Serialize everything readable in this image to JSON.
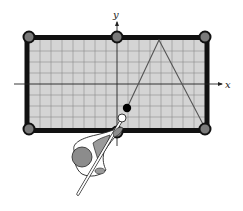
{
  "figure": {
    "axis_labels": {
      "x": "x",
      "y": "y"
    },
    "colors": {
      "table_felt": "#d4d4d4",
      "grid_line": "#8a8a8a",
      "cushion": "#111111",
      "pocket": "#7a7a7a",
      "axis": "#222222",
      "ball_path": "#555555",
      "object_ball": "#000000",
      "cue_ball": "#ffffff",
      "player_head": "#8c8c8c"
    },
    "table": {
      "units_wide": 16,
      "units_tall": 8,
      "x_range": [
        -8,
        8
      ],
      "y_range": [
        -4,
        4
      ]
    },
    "pockets": [
      {
        "name": "top-left",
        "x": -8,
        "y": 4
      },
      {
        "name": "top-middle",
        "x": 0,
        "y": 4
      },
      {
        "name": "top-right",
        "x": 8,
        "y": 4
      },
      {
        "name": "bottom-left",
        "x": -8,
        "y": -4
      },
      {
        "name": "bottom-middle",
        "x": 0,
        "y": -4
      },
      {
        "name": "bottom-right",
        "x": 8,
        "y": -4
      }
    ],
    "balls": {
      "object_ball": {
        "x": 1,
        "y": -2.2
      },
      "cue_ball": {
        "x": 0.5,
        "y": -3.1
      }
    },
    "path": [
      {
        "x": 1,
        "y": -2.2
      },
      {
        "x": 3.8,
        "y": 4
      },
      {
        "x": 8,
        "y": -4
      }
    ]
  }
}
